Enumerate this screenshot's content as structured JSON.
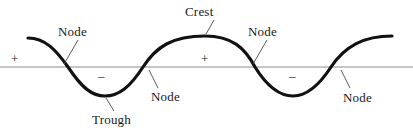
{
  "figure": {
    "type": "wave-anatomy-diagram",
    "background_color": "#ffffff",
    "wave_color": "#111111",
    "axis_color": "#8c8c8c",
    "leader_color": "#4a4a4a",
    "text_color": "#1a1a1a"
  },
  "labels": {
    "node_top_left": "Node",
    "crest": "Crest",
    "node_top_right": "Node",
    "node_bottom_left": "Node",
    "trough": "Trough",
    "node_bottom_right": "Node"
  },
  "signs": {
    "plus_left": "+",
    "minus_left": "–",
    "plus_right": "+",
    "minus_right": "–"
  },
  "chart_data": {
    "type": "line",
    "title": "",
    "xlabel": "",
    "ylabel": "",
    "grid": false,
    "legend": "none",
    "axis": {
      "baseline_y": 67,
      "x_start": 0,
      "x_end": 413
    },
    "wave": {
      "amplitude_px": 29,
      "wavelength_px": 188,
      "crest_y": 38,
      "trough_y": 96,
      "crests_x": [
        30,
        205,
        395
      ],
      "troughs_x": [
        105,
        293
      ],
      "nodes_x": [
        62,
        150,
        250,
        340
      ],
      "path": "M 28,38 C 45,38 56,50 68,67 C 82,88 92,96 105,96 C 119,96 130,87 143,67 C 156,47 172,36 205,36 C 232,36 245,48 255,67 C 268,88 280,96 293,96 C 306,96 318,87 331,67 C 345,46 364,36 392,36"
    },
    "annotations": [
      {
        "text": "Node",
        "label_x": 58,
        "label_y": 25,
        "target_x": 62,
        "target_y": 67,
        "leader": [
          78,
          40,
          64,
          64
        ]
      },
      {
        "text": "Crest",
        "label_x": 185,
        "label_y": 5,
        "target_x": 205,
        "target_y": 36,
        "leader": [
          214,
          20,
          206,
          34
        ]
      },
      {
        "text": "Node",
        "label_x": 248,
        "label_y": 25,
        "target_x": 250,
        "target_y": 67,
        "leader": [
          267,
          40,
          253,
          64
        ]
      },
      {
        "text": "Node",
        "label_x": 151,
        "label_y": 90,
        "target_x": 150,
        "target_y": 67,
        "leader": [
          158,
          88,
          149,
          70
        ]
      },
      {
        "text": "Trough",
        "label_x": 92,
        "label_y": 113,
        "target_x": 105,
        "target_y": 96,
        "leader": [
          114,
          111,
          106,
          98
        ]
      },
      {
        "text": "Node",
        "label_x": 343,
        "label_y": 91,
        "target_x": 340,
        "target_y": 67,
        "leader": [
          350,
          88,
          341,
          70
        ]
      }
    ],
    "sign_markers": [
      {
        "symbol": "+",
        "x": 14,
        "y": 57,
        "region": "first-crest-positive"
      },
      {
        "symbol": "–",
        "x": 102,
        "y": 75,
        "region": "first-trough-negative"
      },
      {
        "symbol": "+",
        "x": 205,
        "y": 57,
        "region": "second-crest-positive"
      },
      {
        "symbol": "–",
        "x": 293,
        "y": 75,
        "region": "second-trough-negative"
      }
    ]
  }
}
